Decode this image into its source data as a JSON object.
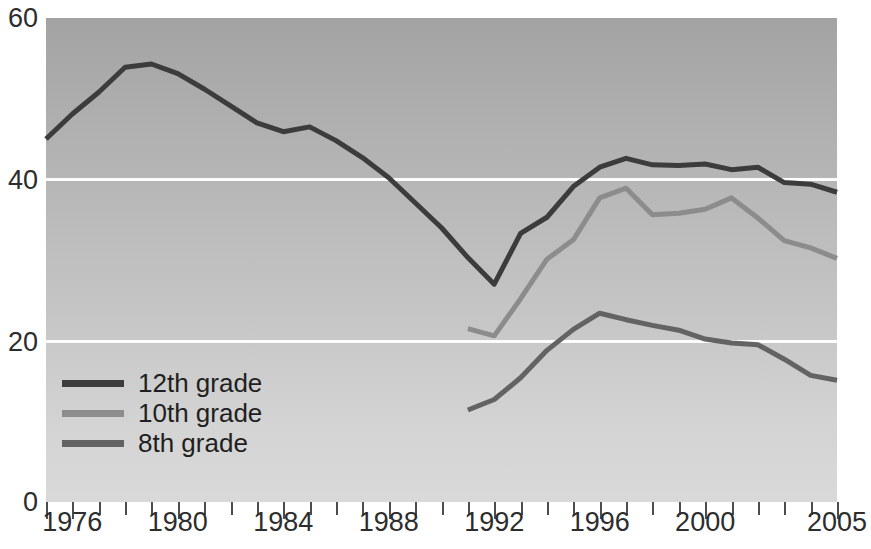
{
  "chart_data": {
    "type": "line",
    "title": "",
    "subtitle": "",
    "xlabel": "",
    "ylabel": "",
    "xlim": [
      1975,
      2005
    ],
    "ylim": [
      0,
      60
    ],
    "grid": true,
    "gridlines_y": [
      20,
      40
    ],
    "legend_position": "inside-bottom-left",
    "y_ticks": [
      0,
      20,
      40,
      60
    ],
    "y_tick_labels": [
      "0",
      "20",
      "40",
      "60"
    ],
    "x_ticks": [
      1975,
      1976,
      1977,
      1978,
      1979,
      1980,
      1981,
      1982,
      1983,
      1984,
      1985,
      1986,
      1987,
      1988,
      1989,
      1990,
      1991,
      1992,
      1993,
      1994,
      1995,
      1996,
      1997,
      1998,
      1999,
      2000,
      2001,
      2002,
      2003,
      2004,
      2005
    ],
    "x_tick_labels_shown": [
      "1976",
      "1980",
      "1984",
      "1988",
      "1992",
      "1996",
      "2000",
      "2005"
    ],
    "x_tick_label_values": [
      1976,
      1980,
      1984,
      1988,
      1992,
      1996,
      2000,
      2005
    ],
    "series": [
      {
        "name": "12th grade",
        "color": "#3c3c3c",
        "x": [
          1975,
          1976,
          1977,
          1978,
          1979,
          1980,
          1981,
          1982,
          1983,
          1984,
          1985,
          1986,
          1987,
          1988,
          1989,
          1990,
          1991,
          1992,
          1993,
          1994,
          1995,
          1996,
          1997,
          1998,
          1999,
          2000,
          2001,
          2002,
          2003,
          2004,
          2005
        ],
        "values": [
          45.0,
          48.1,
          50.8,
          53.9,
          54.3,
          53.1,
          51.2,
          49.1,
          47.0,
          45.9,
          46.5,
          44.8,
          42.7,
          40.2,
          37.1,
          34.0,
          30.3,
          27.0,
          33.3,
          35.3,
          39.1,
          41.5,
          42.6,
          41.8,
          41.7,
          41.9,
          41.2,
          41.5,
          39.6,
          39.4,
          38.4
        ]
      },
      {
        "name": "10th grade",
        "color": "#8c8c8c",
        "x": [
          1991,
          1992,
          1993,
          1994,
          1995,
          1996,
          1997,
          1998,
          1999,
          2000,
          2001,
          2002,
          2003,
          2004,
          2005
        ],
        "values": [
          21.5,
          20.6,
          25.2,
          30.1,
          32.5,
          37.7,
          38.9,
          35.6,
          35.8,
          36.3,
          37.7,
          35.2,
          32.4,
          31.5,
          30.2
        ]
      },
      {
        "name": "8th grade",
        "color": "#636363",
        "x": [
          1991,
          1992,
          1993,
          1994,
          1995,
          1996,
          1997,
          1998,
          1999,
          2000,
          2001,
          2002,
          2003,
          2004,
          2005
        ],
        "values": [
          11.4,
          12.7,
          15.4,
          18.8,
          21.4,
          23.4,
          22.6,
          21.9,
          21.3,
          20.2,
          19.7,
          19.5,
          17.7,
          15.7,
          15.1
        ]
      }
    ]
  },
  "legend": {
    "items": [
      {
        "label": "12th grade",
        "color": "#3c3c3c"
      },
      {
        "label": "10th grade",
        "color": "#8c8c8c"
      },
      {
        "label": "8th grade",
        "color": "#636363"
      }
    ]
  },
  "axis": {
    "y_labels": [
      "60",
      "40",
      "20",
      "0"
    ],
    "x_labels": [
      "1976",
      "1980",
      "1984",
      "1988",
      "1992",
      "1996",
      "2000",
      "2005"
    ]
  }
}
